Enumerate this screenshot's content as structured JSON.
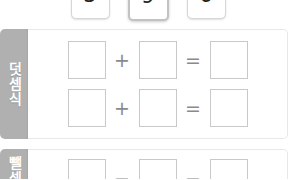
{
  "number_cards": {
    "cards": [
      {
        "value": "3",
        "selected": false
      },
      {
        "value": "9",
        "selected": true
      },
      {
        "value": "6",
        "selected": false
      }
    ]
  },
  "sections": [
    {
      "id": "addition",
      "tab_label": "덧셈식",
      "rows": [
        {
          "operator": "+",
          "equals": "=",
          "box1": "",
          "box2": "",
          "box3": ""
        },
        {
          "operator": "+",
          "equals": "=",
          "box1": "",
          "box2": "",
          "box3": ""
        }
      ]
    },
    {
      "id": "subtraction",
      "tab_label": "뺄셈식",
      "rows": [
        {
          "operator": "−",
          "equals": "−",
          "box1": "",
          "box2": "",
          "box3": ""
        }
      ]
    }
  ],
  "colors": {
    "tab_gray": "#b0b0b0",
    "box_border": "#c9c9c9",
    "operator_gray": "#8a8a8a",
    "panel_border": "#e8e8e8"
  }
}
